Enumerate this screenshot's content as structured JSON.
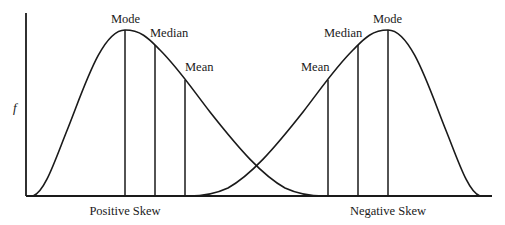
{
  "diagram": {
    "y_axis_label": "f",
    "positive_skew": {
      "caption": "Positive Skew",
      "labels": {
        "mode": "Mode",
        "median": "Median",
        "mean": "Mean"
      }
    },
    "negative_skew": {
      "caption": "Negative Skew",
      "labels": {
        "mean": "Mean",
        "median": "Median",
        "mode": "Mode"
      }
    },
    "colors": {
      "ink": "#1a1a1a",
      "background": "#ffffff"
    }
  }
}
